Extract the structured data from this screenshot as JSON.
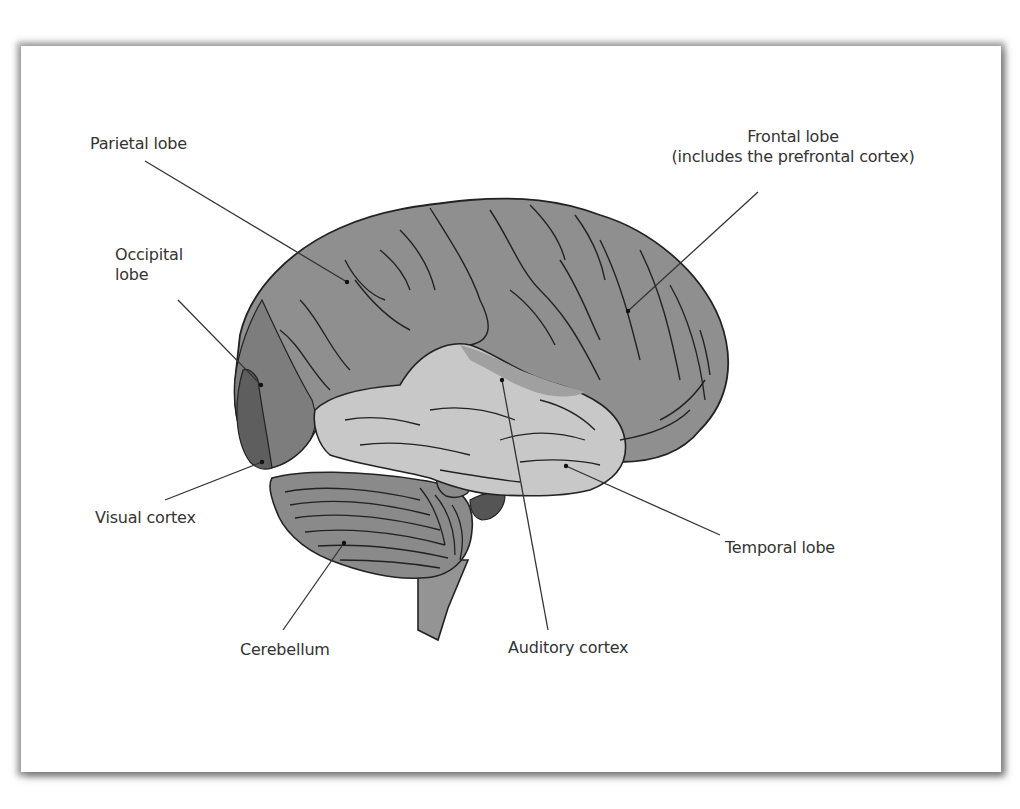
{
  "diagram": {
    "labels": {
      "parietal": "Parietal lobe",
      "frontal_line1": "Frontal lobe",
      "frontal_line2": "(includes the prefrontal cortex)",
      "occipital_line1": "Occipital",
      "occipital_line2": "lobe",
      "visual": "Visual cortex",
      "cerebellum": "Cerebellum",
      "auditory": "Auditory cortex",
      "temporal": "Temporal lobe"
    },
    "colors": {
      "lobe_gray": "#8f8f8f",
      "temporal_light": "#c6c6c6",
      "visual_dark": "#5e5e5e",
      "occipital_mid": "#7b7b7b",
      "cerebellum": "#8a8a8a",
      "brainstem": "#949494",
      "outline": "#222222",
      "label_text": "#333333"
    }
  }
}
